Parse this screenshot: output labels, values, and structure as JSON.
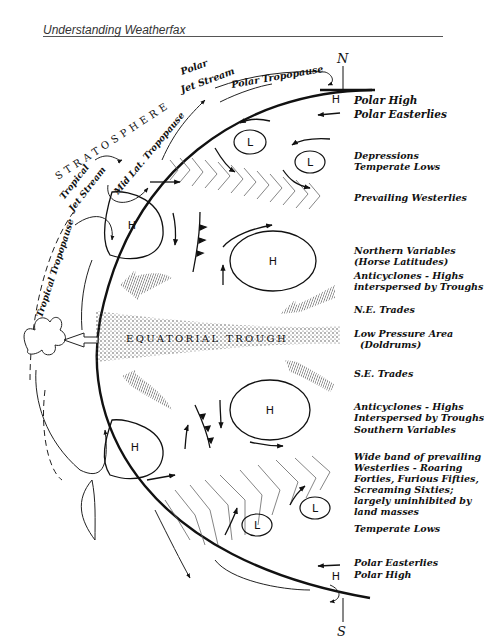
{
  "header": {
    "title": "Understanding Weatherfax"
  },
  "poles": {
    "north": "N",
    "south": "S"
  },
  "atmosphere": {
    "stratosphere": "STRATOSPHERE",
    "polar_jet": [
      "Polar",
      "Jet Stream"
    ],
    "polar_tropopause": "Polar Tropopause",
    "mid_lat_tropopause": "Mid Lat. Tropopause",
    "tropical_jet": [
      "Tropical",
      "Jet Stream"
    ],
    "tropical_tropopause": "Tropical Tropopause",
    "equatorial_trough": "EQUATORIAL TROUGH"
  },
  "pressure_markers": {
    "high": "H",
    "low": "L"
  },
  "zones": [
    {
      "id": "polar-high-n",
      "lines": [
        "Polar High"
      ]
    },
    {
      "id": "polar-easterlies-n",
      "lines": [
        "Polar Easterlies"
      ]
    },
    {
      "id": "depressions",
      "lines": [
        "Depressions",
        "Temperate Lows"
      ]
    },
    {
      "id": "prevailing-westerlies",
      "lines": [
        "Prevailing Westerlies"
      ]
    },
    {
      "id": "northern-variables",
      "lines": [
        "Northern Variables",
        "(Horse Latitudes)"
      ]
    },
    {
      "id": "anticyclones-n",
      "lines": [
        "Anticyclones - Highs",
        "interspersed by Troughs"
      ]
    },
    {
      "id": "ne-trades",
      "lines": [
        "N.E. Trades"
      ]
    },
    {
      "id": "doldrums",
      "lines": [
        "Low Pressure Area",
        "(Doldrums)"
      ]
    },
    {
      "id": "se-trades",
      "lines": [
        "S.E. Trades"
      ]
    },
    {
      "id": "anticyclones-s",
      "lines": [
        "Anticyclones - Highs",
        "Interspersed by Troughs"
      ]
    },
    {
      "id": "southern-variables",
      "lines": [
        "Southern Variables"
      ]
    },
    {
      "id": "roaring-forties",
      "lines": [
        "Wide band of prevailing",
        "Westerlies - Roaring",
        "Forties, Furious Fifties,",
        "Screaming Sixties;",
        "largely uninhibited by",
        "land masses"
      ]
    },
    {
      "id": "temperate-lows-s",
      "lines": [
        "Temperate Lows"
      ]
    },
    {
      "id": "polar-easterlies-s",
      "lines": [
        "Polar Easterlies"
      ]
    },
    {
      "id": "polar-high-s",
      "lines": [
        "Polar High"
      ]
    }
  ]
}
